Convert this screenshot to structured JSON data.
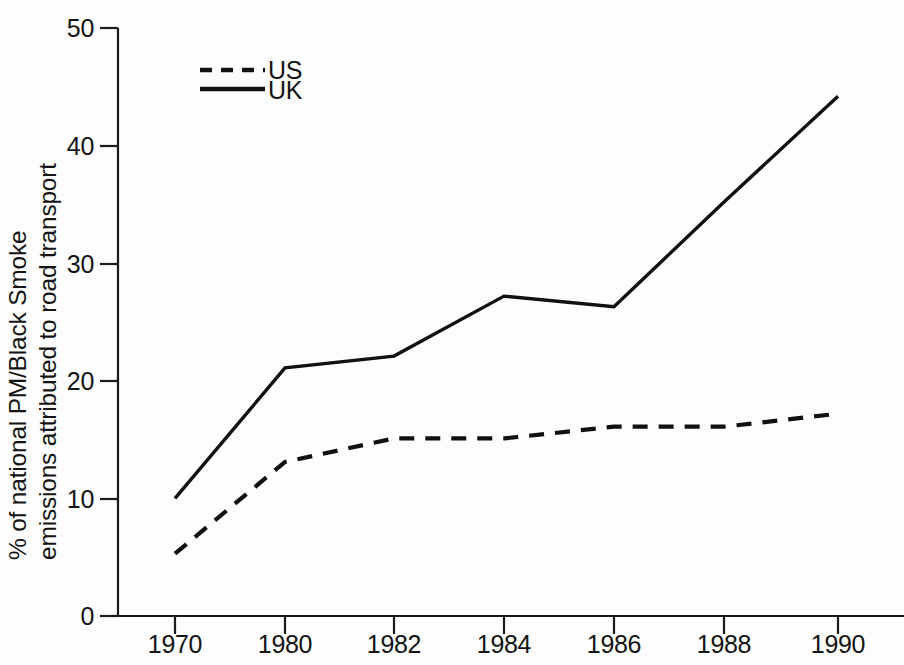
{
  "chart_data": {
    "type": "line",
    "title": "",
    "xlabel": "",
    "ylabel": "% of national PM/Black Smoke emissions attributed to road transport",
    "ylabel_line_1": "% of national PM/Black Smoke",
    "ylabel_line_2": "emissions attributed to road transport",
    "categories": [
      "1970",
      "1980",
      "1982",
      "1984",
      "1986",
      "1988",
      "1990"
    ],
    "ylim": [
      0,
      50
    ],
    "yticks": [
      0,
      10,
      20,
      30,
      40,
      50
    ],
    "ytick_labels": [
      "0",
      "10",
      "20",
      "30",
      "40",
      "50"
    ],
    "grid": false,
    "legend_position": "top-left-inside",
    "series": [
      {
        "name": "US",
        "style": "dashed",
        "color": "#111111",
        "values": [
          5.3,
          13.1,
          15.1,
          15.1,
          16.1,
          16.1,
          17.2
        ]
      },
      {
        "name": "UK",
        "style": "solid",
        "color": "#111111",
        "values": [
          10.0,
          21.1,
          22.1,
          27.2,
          26.3,
          35.2,
          44.2
        ]
      }
    ]
  },
  "axes": {
    "y_tick_count": 6,
    "x_tick_count": 7
  },
  "legend": {
    "entries": [
      {
        "label": "US",
        "style": "dashed"
      },
      {
        "label": "UK",
        "style": "solid"
      }
    ]
  },
  "colors": {
    "axis": "#1a1a1a",
    "series": "#111111",
    "background": "#fdfdfd",
    "text": "#141414"
  }
}
